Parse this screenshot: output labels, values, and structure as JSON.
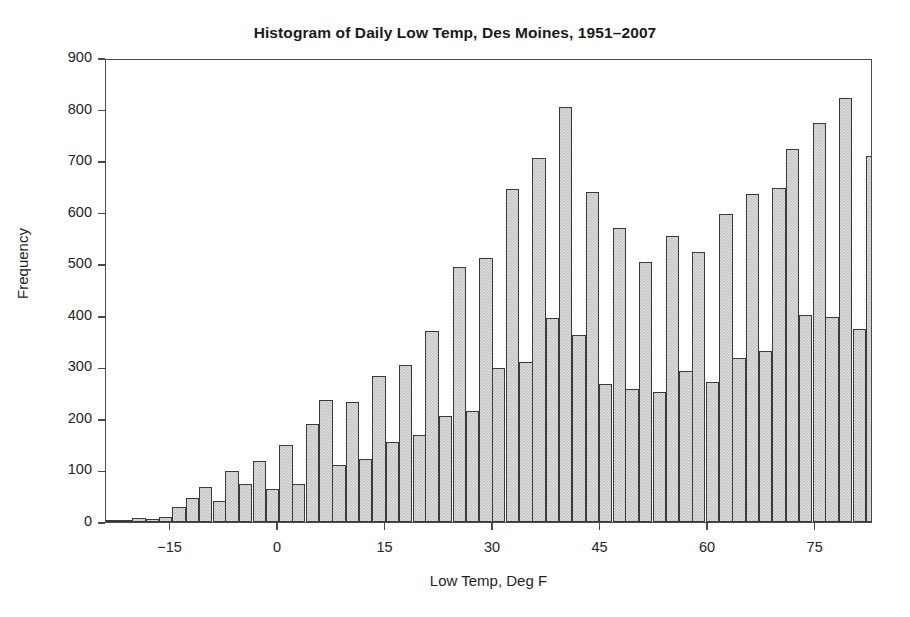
{
  "chart_data": {
    "type": "bar",
    "title": "Histogram of Daily Low Temp, Des Moines, 1951–2007",
    "xlabel": "Low Temp, Deg F",
    "ylabel": "Frequency",
    "xlim": [
      -24,
      83
    ],
    "ylim": [
      0,
      900
    ],
    "grid": false,
    "legend": null,
    "bin_width": 1.86,
    "xticks": [
      -15,
      0,
      15,
      30,
      45,
      60,
      75
    ],
    "xtick_labels": [
      "−15",
      "0",
      "15",
      "30",
      "45",
      "60",
      "75"
    ],
    "yticks": [
      0,
      100,
      200,
      300,
      400,
      500,
      600,
      700,
      800,
      900
    ],
    "ytick_labels": [
      "0",
      "100",
      "200",
      "300",
      "400",
      "500",
      "600",
      "700",
      "800",
      "900"
    ],
    "bar_fill": "#c3c3c3",
    "bar_edge": "#3a3a3a",
    "axis_color": "#4a4a4a",
    "x": [
      -23.1,
      -21.2,
      -19.4,
      -17.5,
      -15.7,
      -13.8,
      -11.9,
      -10.1,
      -8.2,
      -6.4,
      -4.5,
      -2.6,
      -0.8,
      1.1,
      2.9,
      4.8,
      6.7,
      8.5,
      10.4,
      12.2,
      14.1,
      16.0,
      17.8,
      19.7,
      21.5,
      23.4,
      25.3,
      27.1,
      29.0,
      30.8,
      32.7,
      34.6,
      36.4,
      38.3,
      40.1,
      42.0,
      43.9,
      45.7,
      47.6,
      49.4,
      51.3,
      53.2,
      55.0,
      56.9,
      58.7,
      60.6,
      62.5,
      64.3,
      66.2,
      68.0,
      69.9,
      71.8,
      73.6,
      75.5,
      77.3,
      79.2,
      81.1
    ],
    "values": [
      3,
      2,
      7,
      5,
      9,
      30,
      46,
      67,
      41,
      99,
      73,
      118,
      64,
      150,
      74,
      191,
      236,
      110,
      232,
      122,
      283,
      155,
      305,
      168,
      371,
      205,
      495,
      215,
      512,
      299,
      645,
      311,
      707,
      395,
      805,
      363,
      641,
      267,
      570,
      258,
      504,
      253,
      554,
      293,
      524,
      272,
      597,
      318,
      637,
      331,
      648,
      723,
      401,
      773,
      398,
      823,
      375
    ],
    "values_tail": [
      710,
      290,
      478,
      163,
      240,
      55,
      12
    ],
    "note": "Alternating tall/short pattern arises from rounded Fahrenheit readings; peak bar ≈ 823 near 64°F, secondary peak ≈ 805 near 32°F"
  },
  "chart": {
    "title": "Histogram of Daily Low Temp, Des Moines, 1951–2007",
    "x_axis_title": "Low Temp, Deg F",
    "y_axis_title": "Frequency"
  }
}
